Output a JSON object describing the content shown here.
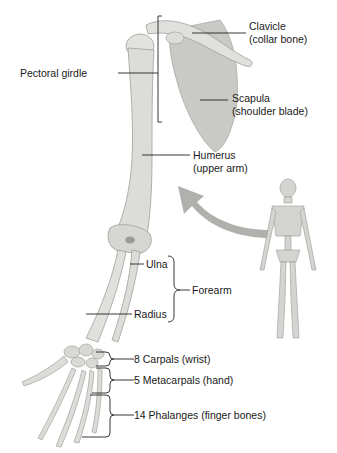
{
  "diagram": {
    "colors": {
      "bone": "#dcdcd8",
      "bone_shadow": "#b8b8b4",
      "scapula": "#c9c9c6",
      "arrow": "#b0b0ad",
      "line": "#222222"
    },
    "labels": {
      "clavicle": "Clavicle",
      "clavicle_sub": "(collar bone)",
      "pectoral_girdle": "Pectoral girdle",
      "scapula": "Scapula",
      "scapula_sub": "(shoulder blade)",
      "humerus": "Humerus",
      "humerus_sub": "(upper arm)",
      "ulna": "Ulna",
      "forearm": "Forearm",
      "radius": "Radius",
      "carpals": "8 Carpals (wrist)",
      "metacarpals": "5 Metacarpals (hand)",
      "phalanges": "14 Phalanges (finger bones)"
    }
  }
}
